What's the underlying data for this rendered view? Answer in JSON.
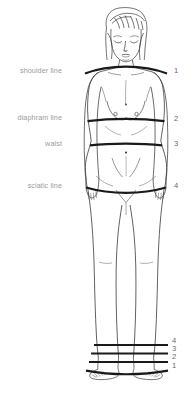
{
  "diagram": {
    "label_color": "#9a9a9a",
    "number_color": "#6a6a6a",
    "outline_color": "#333333",
    "marker_line_color": "#1a1a1a",
    "background_color": "#ffffff",
    "labels": [
      {
        "text": "shoulder line",
        "number": "1",
        "y": 70
      },
      {
        "text": "diaphram line",
        "number": "2",
        "y": 117
      },
      {
        "text": "waist",
        "number": "3",
        "y": 143
      },
      {
        "text": "sciatic line",
        "number": "4",
        "y": 185
      }
    ],
    "foot_scale_numbers": [
      "4",
      "3",
      "2",
      "1"
    ]
  }
}
